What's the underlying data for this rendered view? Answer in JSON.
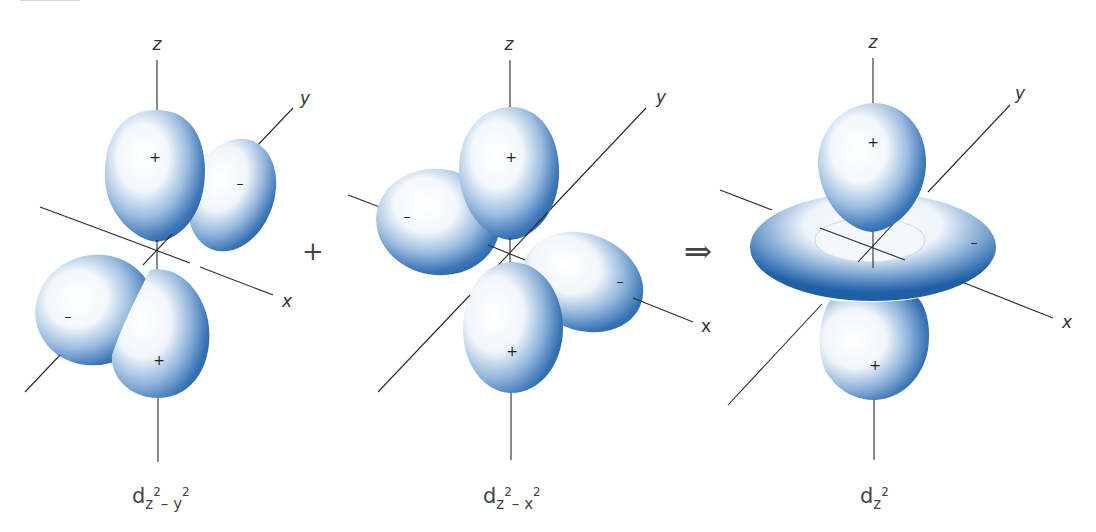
{
  "figure": {
    "colors": {
      "lobe_edge": "#1f5fa6",
      "lobe_mid": "#6f9ed1",
      "lobe_highlight": "#ffffff",
      "axis": "#2a2a2a",
      "text": "#444444"
    },
    "operators": {
      "plus": "+",
      "implies": "⇒"
    },
    "panels": [
      {
        "id": "dz2-y2",
        "caption_main": "d",
        "caption_sub": "z",
        "caption_sup1": "2",
        "caption_mid": "– y",
        "caption_sup2": "2",
        "axes": {
          "z": "z",
          "y": "y",
          "x": "x"
        },
        "lobes": [
          {
            "position": "top",
            "sign": "+"
          },
          {
            "position": "back-right",
            "sign": "–"
          },
          {
            "position": "front-left",
            "sign": "–"
          },
          {
            "position": "bottom",
            "sign": "+"
          }
        ]
      },
      {
        "id": "dz2-x2",
        "caption_main": "d",
        "caption_sub": "z",
        "caption_sup1": "2",
        "caption_mid": "– x",
        "caption_sup2": "2",
        "axes": {
          "z": "z",
          "y": "y",
          "x": "x"
        },
        "lobes": [
          {
            "position": "top",
            "sign": "+"
          },
          {
            "position": "left",
            "sign": "–"
          },
          {
            "position": "right",
            "sign": "–"
          },
          {
            "position": "bottom",
            "sign": "+"
          }
        ]
      },
      {
        "id": "dz2",
        "caption_main": "d",
        "caption_sub": "z",
        "caption_sup1": "2",
        "axes": {
          "z": "z",
          "y": "y",
          "x": "x"
        },
        "lobes": [
          {
            "position": "top",
            "sign": "+"
          },
          {
            "position": "torus",
            "sign": "–"
          },
          {
            "position": "bottom",
            "sign": "+"
          }
        ]
      }
    ]
  }
}
